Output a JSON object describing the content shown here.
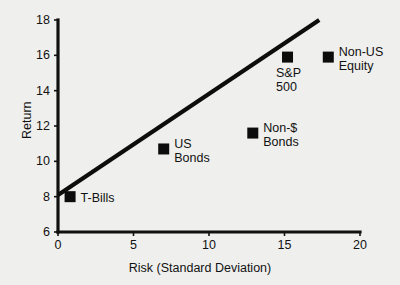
{
  "chart_data": {
    "type": "scatter",
    "title": "",
    "xlabel": "Risk (Standard  Deviation)",
    "ylabel": "Return",
    "xlim": [
      0,
      20
    ],
    "ylim": [
      6,
      18
    ],
    "xticks": [
      0,
      5,
      10,
      15,
      20
    ],
    "yticks": [
      6,
      8,
      10,
      12,
      14,
      16,
      18
    ],
    "xtick_labels": [
      "0",
      "5",
      "10",
      "15",
      "20"
    ],
    "ytick_labels": [
      "6",
      "8",
      "10",
      "12",
      "14",
      "16",
      "18"
    ],
    "grid": false,
    "legend": "none",
    "marker_color": "#0c0c0c",
    "line_color": "#0d0d0d",
    "points": [
      {
        "name": "T-Bills",
        "label": "T-Bills",
        "x": 0.8,
        "y": 8.0,
        "label_pos": "right"
      },
      {
        "name": "US Bonds",
        "label": "US\nBonds",
        "x": 7.0,
        "y": 10.7,
        "label_pos": "right"
      },
      {
        "name": "Non-$ Bonds",
        "label": "Non-$\nBonds",
        "x": 12.9,
        "y": 11.6,
        "label_pos": "right"
      },
      {
        "name": "S&P 500",
        "label": "S&P\n500",
        "x": 15.2,
        "y": 15.9,
        "label_pos": "below-left"
      },
      {
        "name": "Non-US Equity",
        "label": "Non-US\nEquity",
        "x": 17.9,
        "y": 15.9,
        "label_pos": "right"
      }
    ],
    "trend_line": {
      "name": "capital market line",
      "x0": 0.0,
      "y0": 8.1,
      "x1": 17.3,
      "y1": 18.0
    }
  }
}
